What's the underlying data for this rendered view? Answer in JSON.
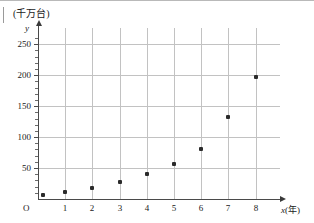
{
  "figure": {
    "unit_label": "(千万台)",
    "y_axis_name": "y",
    "x_axis_name_italic": "x",
    "x_axis_name_unit": "(年)",
    "origin_label": "O"
  },
  "chart_data": {
    "type": "scatter",
    "title": "",
    "subtitle": "",
    "xlabel": "x(年)",
    "ylabel": "y",
    "unit_note": "(千万台)",
    "xlim": [
      0,
      8.6
    ],
    "ylim": [
      0,
      265
    ],
    "grid": true,
    "legend": null,
    "x_ticks": [
      "O",
      "1",
      "2",
      "3",
      "4",
      "5",
      "6",
      "7",
      "8"
    ],
    "x_tick_values": [
      0,
      1,
      2,
      3,
      4,
      5,
      6,
      7,
      8
    ],
    "y_ticks": [
      "50",
      "100",
      "150",
      "200",
      "250"
    ],
    "y_tick_values": [
      50,
      100,
      150,
      200,
      250
    ],
    "y_minor_tick_step": 10,
    "marker": "square",
    "marker_color": "#2b2b2b",
    "grid_color": "#c2c2c2",
    "axis_color": "#4a4a4a",
    "points": [
      {
        "x": 0.2,
        "y": 7
      },
      {
        "x": 1,
        "y": 11
      },
      {
        "x": 2,
        "y": 18
      },
      {
        "x": 3,
        "y": 27
      },
      {
        "x": 4,
        "y": 40
      },
      {
        "x": 5,
        "y": 57
      },
      {
        "x": 6,
        "y": 81
      },
      {
        "x": 7,
        "y": 132
      },
      {
        "x": 8,
        "y": 197
      }
    ],
    "x": [
      0.2,
      1,
      2,
      3,
      4,
      5,
      6,
      7,
      8
    ],
    "values": [
      7,
      11,
      18,
      27,
      40,
      57,
      81,
      132,
      197
    ]
  }
}
